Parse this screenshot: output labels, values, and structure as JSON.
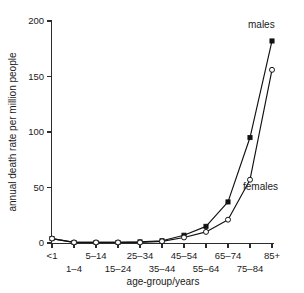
{
  "chart_data": {
    "type": "line",
    "title": "",
    "xlabel": "age-group/years",
    "ylabel": "annual death rate per million people",
    "categories": [
      "<1",
      "1–4",
      "5–14",
      "15–24",
      "25–34",
      "35–44",
      "45–54",
      "55–64",
      "65–74",
      "75–84",
      "85+"
    ],
    "yticks": [
      0,
      50,
      100,
      150,
      200
    ],
    "ylim": [
      0,
      200
    ],
    "grid": false,
    "legend_position": "inline-annotations",
    "series": [
      {
        "name": "males",
        "marker": "filled-square",
        "values": [
          4,
          0.5,
          0.5,
          0.5,
          1,
          2,
          7,
          15,
          37,
          95,
          182
        ]
      },
      {
        "name": "females",
        "marker": "open-circle",
        "values": [
          4,
          0.5,
          0.5,
          0.5,
          0.5,
          1.5,
          5,
          10,
          21,
          57,
          156
        ]
      }
    ],
    "annotations": [
      {
        "text": "males",
        "series": "males",
        "near_category": "85+"
      },
      {
        "text": "females",
        "series": "females",
        "near_category": "75–84"
      }
    ]
  },
  "axes": {
    "y_tick_labels": [
      "0",
      "50",
      "100",
      "150",
      "200"
    ],
    "x_tick_labels": [
      "<1",
      "1–4",
      "5–14",
      "15–24",
      "25–34",
      "35–44",
      "45–54",
      "55–64",
      "65–74",
      "75–84",
      "85+"
    ],
    "x_title": "age-group/years",
    "y_title": "annual death rate per million people"
  },
  "colors": {
    "background": "#ffffff",
    "axis": "#2b2b2b",
    "line": "#111111",
    "text": "#1a1a1a"
  }
}
